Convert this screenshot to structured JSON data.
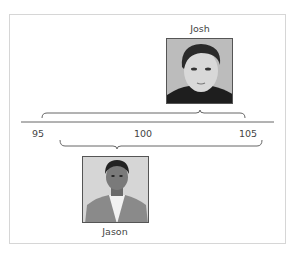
{
  "figure": {
    "people": [
      {
        "name": "Josh",
        "score_range": [
          95.2,
          105
        ],
        "position": "above-axis"
      },
      {
        "name": "Jason",
        "score_range": [
          96,
          106
        ],
        "position": "below-axis"
      }
    ],
    "axis": {
      "ticks": [
        {
          "value": 95,
          "label": "95"
        },
        {
          "value": 100,
          "label": "100"
        },
        {
          "value": 105,
          "label": "105"
        }
      ]
    },
    "colors": {
      "frame": "#d6d6d6",
      "axis": "#666666",
      "brace": "#666666",
      "photo_bg": "#b9b9b9"
    }
  }
}
